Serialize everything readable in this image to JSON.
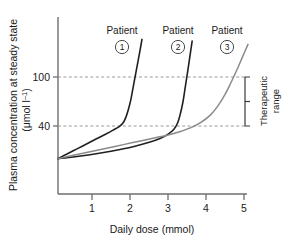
{
  "chart_data": {
    "type": "line",
    "title": "",
    "xlabel": "Daily dose (mmol)",
    "ylabel_line1": "Plasma concentration at steady state",
    "ylabel_line2": "(μmol l",
    "ylabel_line2_sup": "–1",
    "ylabel_line2_end": ")",
    "xlim": [
      0,
      5.3
    ],
    "ylim": [
      0,
      150
    ],
    "xticks": [
      1,
      2,
      3,
      4,
      5
    ],
    "xtick_labels": [
      "1",
      "2",
      "3",
      "4",
      "5"
    ],
    "yticks": [
      40,
      100
    ],
    "ytick_labels": [
      "40",
      "100"
    ],
    "grid": "horizontal-dashed-at-yticks",
    "legend": "inline-labels-above-curves",
    "annotations": [
      {
        "name": "therapeutic-range",
        "text_line1": "Therapeutic",
        "text_line2": "range",
        "y_from": 40,
        "y_to": 100,
        "bracket_x": 4.9
      }
    ],
    "series": [
      {
        "name": "Patient 1",
        "label": "Patient",
        "badge": "1",
        "color": "#231f20",
        "points": [
          [
            0.0,
            0
          ],
          [
            0.25,
            6
          ],
          [
            0.5,
            12
          ],
          [
            0.75,
            18
          ],
          [
            1.0,
            24
          ],
          [
            1.25,
            30
          ],
          [
            1.45,
            35
          ],
          [
            1.6,
            39
          ],
          [
            1.7,
            43
          ],
          [
            1.78,
            50
          ],
          [
            1.85,
            60
          ],
          [
            1.92,
            73
          ],
          [
            1.98,
            88
          ],
          [
            2.04,
            103
          ],
          [
            2.1,
            118
          ],
          [
            2.16,
            133
          ],
          [
            2.21,
            146
          ]
        ]
      },
      {
        "name": "Patient 2",
        "label": "Patient",
        "badge": "2",
        "color": "#231f20",
        "points": [
          [
            0.0,
            0
          ],
          [
            0.4,
            2
          ],
          [
            0.8,
            4.5
          ],
          [
            1.2,
            7.5
          ],
          [
            1.6,
            11
          ],
          [
            2.0,
            15
          ],
          [
            2.4,
            20
          ],
          [
            2.7,
            25
          ],
          [
            2.9,
            30
          ],
          [
            3.05,
            36
          ],
          [
            3.15,
            44
          ],
          [
            3.22,
            55
          ],
          [
            3.29,
            70
          ],
          [
            3.35,
            88
          ],
          [
            3.41,
            106
          ],
          [
            3.47,
            125
          ],
          [
            3.53,
            144
          ]
        ]
      },
      {
        "name": "Patient 3",
        "label": "Patient",
        "badge": "3",
        "color": "#8a8a8a",
        "points": [
          [
            0.0,
            0
          ],
          [
            0.5,
            5
          ],
          [
            1.0,
            10
          ],
          [
            1.5,
            15
          ],
          [
            2.0,
            20
          ],
          [
            2.5,
            25
          ],
          [
            2.9,
            29
          ],
          [
            3.2,
            33
          ],
          [
            3.5,
            38
          ],
          [
            3.75,
            44
          ],
          [
            4.0,
            53
          ],
          [
            4.2,
            64
          ],
          [
            4.4,
            79
          ],
          [
            4.55,
            93
          ],
          [
            4.7,
            108
          ],
          [
            4.85,
            124
          ],
          [
            5.0,
            140
          ]
        ]
      }
    ]
  },
  "labels": {
    "patient1": {
      "word": "Patient",
      "number": "1"
    },
    "patient2": {
      "word": "Patient",
      "number": "2"
    },
    "patient3": {
      "word": "Patient",
      "number": "3"
    },
    "therapeutic_line1": "Therapeutic",
    "therapeutic_line2": "range",
    "xaxis_title": "Daily dose (mmol)",
    "yaxis_title_top": "Plasma concentration at steady state",
    "yaxis_unit_prefix": "(μmol l",
    "yaxis_unit_sup": "–1",
    "yaxis_unit_suffix": ")",
    "ytick_100": "100",
    "ytick_40": "40",
    "xtick_1": "1",
    "xtick_2": "2",
    "xtick_3": "3",
    "xtick_4": "4",
    "xtick_5": "5"
  },
  "colors": {
    "axis": "#6e6e6e",
    "curve_dark": "#231f20",
    "curve_gray": "#8a8a8a",
    "grid_dash": "#9a9a9a",
    "text": "#1a1a1a"
  }
}
